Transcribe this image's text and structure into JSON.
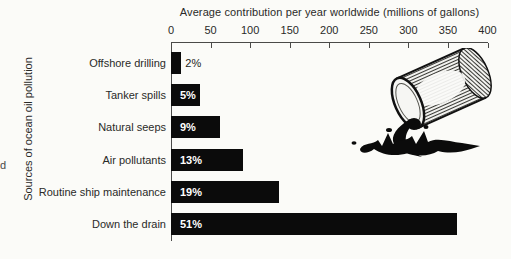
{
  "page": {
    "edge_fragment": "d",
    "background_color": "#fbfbf8"
  },
  "chart_data": {
    "type": "bar",
    "orientation": "horizontal",
    "title": "Average contribution per year worldwide (millions of gallons)",
    "xlabel": "",
    "ylabel": "Sources of ocean oil pollution",
    "xlim": [
      0,
      400
    ],
    "x_ticks": [
      0,
      50,
      100,
      150,
      200,
      250,
      300,
      350,
      400
    ],
    "grid": false,
    "bar_color": "#0b0b0b",
    "categories": [
      "Offshore drilling",
      "Tanker spills",
      "Natural seeps",
      "Air pollutants",
      "Routine ship maintenance",
      "Down the drain"
    ],
    "series": [
      {
        "name": "Average contribution per year worldwide (millions of gallons)",
        "values": [
          13,
          37,
          62,
          91,
          137,
          362
        ]
      }
    ],
    "percent_labels": [
      "2%",
      "5%",
      "9%",
      "13%",
      "19%",
      "51%"
    ],
    "legend": null
  },
  "illustration": {
    "name": "spilled-oil-barrel"
  }
}
